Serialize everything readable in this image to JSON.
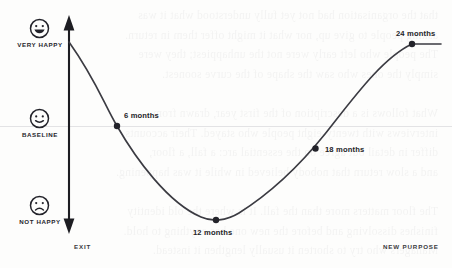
{
  "figure": {
    "axis_captions": {
      "left": "EXIT",
      "right": "NEW PURPOSE"
    },
    "y_markers": [
      {
        "id": "very-happy",
        "label": "VERY HAPPY",
        "icon": "smiley-very-happy-icon",
        "y": 28
      },
      {
        "id": "baseline",
        "label": "BASELINE",
        "icon": "smiley-neutral-icon",
        "y": 118
      },
      {
        "id": "not-happy",
        "label": "NOT HAPPY",
        "icon": "smiley-sad-icon",
        "y": 205
      }
    ],
    "point_labels": [
      {
        "id": "m6",
        "label": "6 months"
      },
      {
        "id": "m12",
        "label": "12 months"
      },
      {
        "id": "m18",
        "label": "18 months"
      },
      {
        "id": "m24",
        "label": "24 months"
      }
    ],
    "colors": {
      "curve": "#3b3b42",
      "point": "#23232a",
      "axis": "#1d1d22",
      "baseline": "#e2e2e4",
      "text": "#26262b",
      "page": "#fdfdfc"
    }
  },
  "chart_data": {
    "type": "line",
    "title": "",
    "xlabel": "",
    "ylabel": "",
    "categories": [
      "Exit",
      "6 months",
      "12 months",
      "18 months",
      "24 months",
      "New purpose"
    ],
    "x": [
      0,
      6,
      12,
      18,
      24,
      27
    ],
    "y_levels": {
      "very_happy": 1,
      "baseline": 0,
      "not_happy": -1
    },
    "ytick_labels": [
      "VERY HAPPY",
      "BASELINE",
      "NOT HAPPY"
    ],
    "values": [
      1.0,
      0.0,
      -1.06,
      0.25,
      0.98,
      0.98
    ],
    "annotations": [
      "",
      "6 months",
      "12 months",
      "18 months",
      "24 months",
      ""
    ],
    "grid": false,
    "legend": null,
    "xlim": [
      0,
      27
    ],
    "ylim": [
      -1.25,
      1.2
    ],
    "baseline_gridline": 0
  },
  "bleed_text": {
    "lines": [
      "that the organisation had not yet fully understood what it was",
      "asking people to give up, nor what it might offer them in return.",
      "The people who left early were not the unhappiest; they were",
      "simply the ones who saw the shape of the curve soonest.",
      "",
      "What follows is a description of the first year, drawn from",
      "interviews with twenty-eight people who stayed. Their accounts",
      "differ in detail but agree on the essential arc: a fall, a floor,",
      "and a slow return that nobody believed in while it was happening.",
      "",
      "The floor matters more than the fall. It is where the old identity",
      "finishes dissolving and before the new one has anything to hold.",
      "Managers who try to shorten it usually lengthen it instead."
    ]
  }
}
